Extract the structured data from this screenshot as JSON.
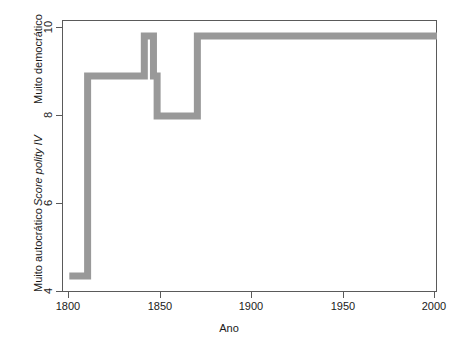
{
  "chart_data": {
    "type": "line",
    "title": "",
    "xlabel": "Ano",
    "ylabel": "Score polity IV",
    "ylabel_top_caption": "Muito democrático",
    "ylabel_bottom_caption": "Muito autocrático",
    "xlim": [
      1796,
      2001
    ],
    "ylim": [
      3.6,
      10.4
    ],
    "xticks": [
      1800,
      1850,
      1900,
      1950,
      2000
    ],
    "xticklabels": [
      "1800",
      "1850",
      "1900",
      "1950",
      "2000"
    ],
    "yticks": [
      4,
      6,
      8,
      10
    ],
    "yticklabels": [
      "4",
      "6",
      "8",
      "10"
    ],
    "grid": false,
    "legend": false,
    "line_color": "#999999",
    "line_width": 4,
    "axis_color": "#5a5a5a",
    "step_style": "post",
    "segments": [
      {
        "x_start": 1800,
        "x_end": 1810,
        "value": 4
      },
      {
        "x_start": 1810,
        "x_end": 1841,
        "value": 9
      },
      {
        "x_start": 1841,
        "x_end": 1846,
        "value": 10
      },
      {
        "x_start": 1846,
        "x_end": 1848,
        "value": 9
      },
      {
        "x_start": 1848,
        "x_end": 1870,
        "value": 8
      },
      {
        "x_start": 1870,
        "x_end": 2001,
        "value": 10
      }
    ],
    "x": [
      1800,
      1810,
      1810,
      1841,
      1841,
      1846,
      1846,
      1848,
      1848,
      1870,
      1870,
      2001
    ],
    "y": [
      4,
      4,
      9,
      9,
      10,
      10,
      9,
      9,
      8,
      8,
      10,
      10
    ]
  }
}
